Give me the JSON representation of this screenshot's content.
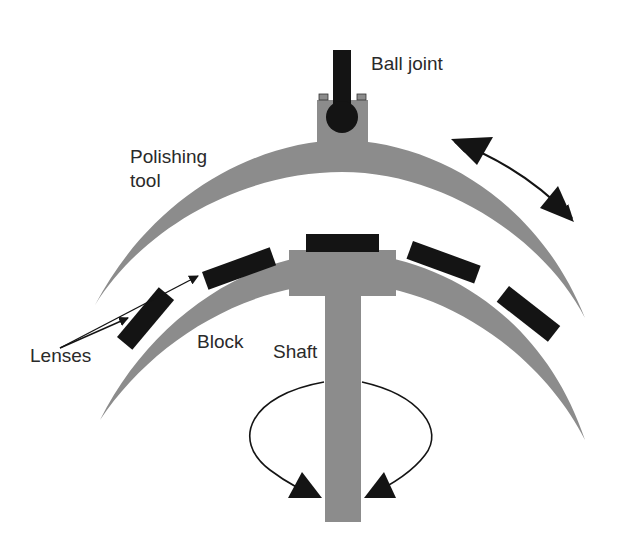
{
  "figure": {
    "labels": {
      "ball_joint": "Ball joint",
      "polishing_tool_line1": "Polishing",
      "polishing_tool_line2": "tool",
      "lenses": "Lenses",
      "block": "Block",
      "shaft": "Shaft"
    },
    "colors": {
      "gray_part": "#8c8c8c",
      "black_part": "#141414",
      "text": "#2a2a2a",
      "background": "#ffffff"
    },
    "motions": [
      {
        "name": "tool-oscillation",
        "description": "double-headed curved arrow"
      },
      {
        "name": "shaft-rotation",
        "description": "looped arrow around shaft"
      }
    ]
  }
}
